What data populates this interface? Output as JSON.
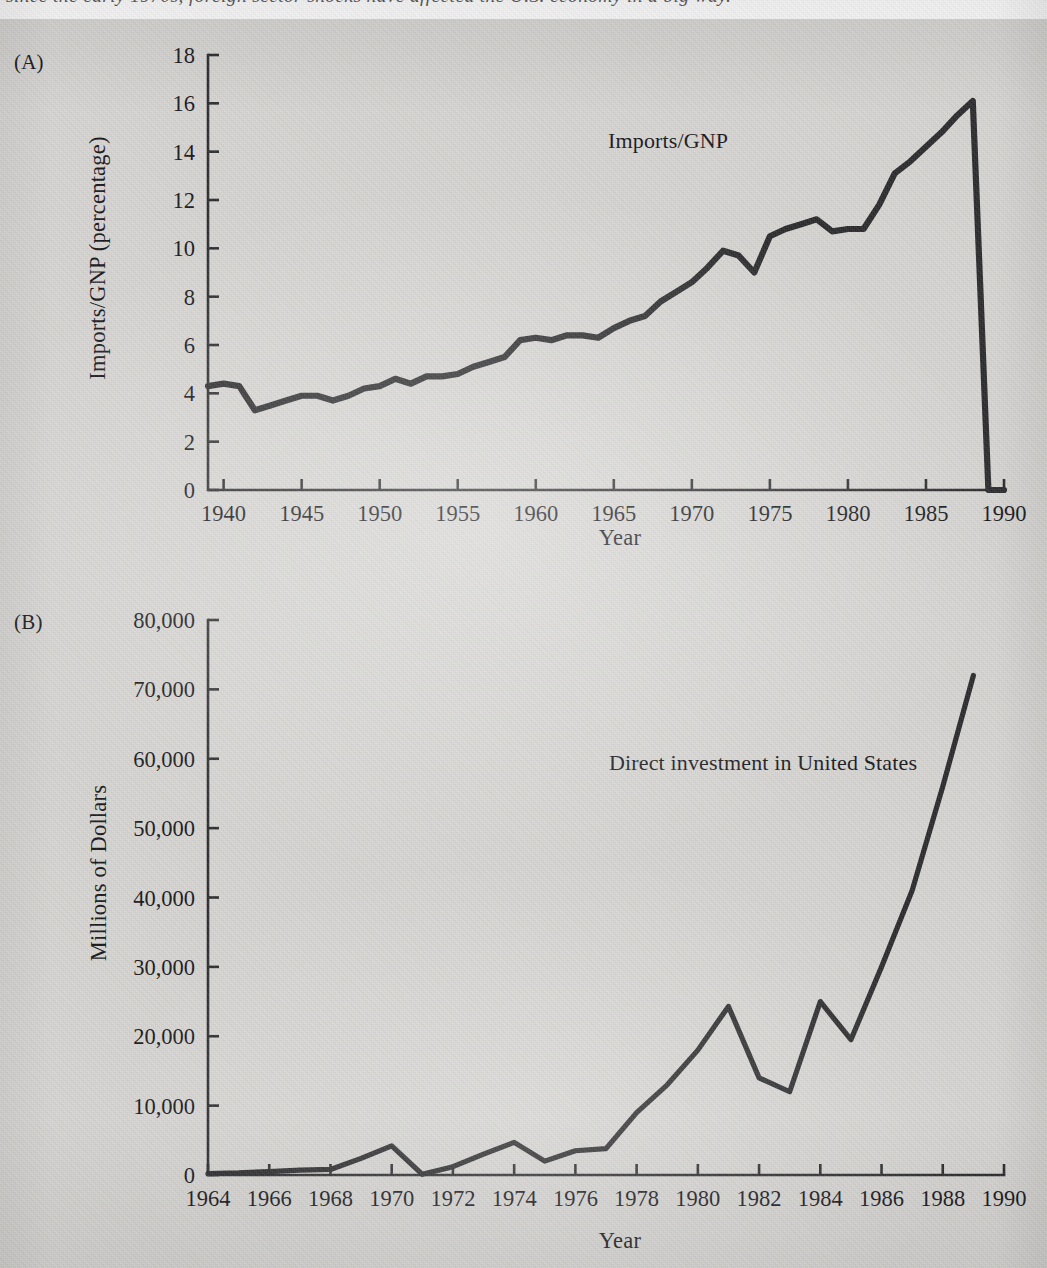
{
  "page": {
    "background_color": "#d7d6d3",
    "ink_color": "#2b2b2d",
    "caption_text": "since the early 1970s, foreign sector shocks have affected the U.S. economy in a big way."
  },
  "panel_a": {
    "letter": "(A)",
    "series_label": "Imports/GNP",
    "ylabel": "Imports/GNP (percentage)",
    "xlabel": "Year"
  },
  "panel_b": {
    "letter": "(B)",
    "series_label": "Direct investment in United States",
    "ylabel": "Millions of Dollars",
    "xlabel": "Year"
  },
  "chart_data": [
    {
      "type": "line",
      "id": "panel-a",
      "title": "(A) Imports/GNP",
      "xlabel": "Year",
      "ylabel": "Imports/GNP (percentage)",
      "xlim": [
        1939,
        1990
      ],
      "ylim": [
        0,
        18
      ],
      "yticks": [
        0,
        2,
        4,
        6,
        8,
        10,
        12,
        14,
        16,
        18
      ],
      "ytick_labels": [
        "0",
        "2",
        "4",
        "6",
        "8",
        "10",
        "12",
        "14",
        "16",
        "18"
      ],
      "xticks": [
        1940,
        1945,
        1950,
        1955,
        1960,
        1965,
        1970,
        1975,
        1980,
        1985,
        1990
      ],
      "xtick_labels": [
        "1940",
        "1945",
        "1950",
        "1955",
        "1960",
        "1965",
        "1970",
        "1975",
        "1980",
        "1985",
        "1990"
      ],
      "grid": false,
      "legend": "inline-annotation",
      "annotations": [
        {
          "text": "Imports/GNP",
          "x": 1976,
          "y": 14.1
        }
      ],
      "series": [
        {
          "name": "Imports/GNP",
          "x": [
            1939,
            1940,
            1941,
            1942,
            1943,
            1944,
            1945,
            1946,
            1947,
            1948,
            1949,
            1950,
            1951,
            1952,
            1953,
            1954,
            1955,
            1956,
            1957,
            1958,
            1959,
            1960,
            1961,
            1962,
            1963,
            1964,
            1965,
            1966,
            1967,
            1968,
            1969,
            1970,
            1971,
            1972,
            1973,
            1974,
            1975,
            1976,
            1977,
            1978,
            1979,
            1980,
            1981,
            1982,
            1983,
            1984,
            1985,
            1986,
            1987,
            1988,
            1989,
            1990
          ],
          "values": [
            4.3,
            4.4,
            4.3,
            3.3,
            3.5,
            3.7,
            3.9,
            3.9,
            3.7,
            3.9,
            4.2,
            4.3,
            4.6,
            4.4,
            4.7,
            4.7,
            4.8,
            5.1,
            5.3,
            5.5,
            6.2,
            6.3,
            6.2,
            6.4,
            6.4,
            6.3,
            6.7,
            7.0,
            7.2,
            7.8,
            8.2,
            8.6,
            9.2,
            9.9,
            9.7,
            9.0,
            10.5,
            10.8,
            11.0,
            11.2,
            10.7,
            10.8,
            10.8,
            11.8,
            13.1,
            13.6,
            14.2,
            14.8,
            15.5,
            16.1,
            0,
            0
          ]
        }
      ],
      "note": "last two entries unused; series drawn 1939-1989 ending near 16.1"
    },
    {
      "type": "line",
      "id": "panel-b",
      "title": "(B) Direct investment in United States",
      "xlabel": "Year",
      "ylabel": "Millions of Dollars",
      "xlim": [
        1964,
        1990
      ],
      "ylim": [
        0,
        80000
      ],
      "yticks": [
        0,
        10000,
        20000,
        30000,
        40000,
        50000,
        60000,
        70000,
        80000
      ],
      "ytick_labels": [
        "0",
        "10,000",
        "20,000",
        "30,000",
        "40,000",
        "50,000",
        "60,000",
        "70,000",
        "80,000"
      ],
      "xticks": [
        1964,
        1966,
        1968,
        1970,
        1972,
        1974,
        1976,
        1978,
        1980,
        1982,
        1984,
        1986,
        1988,
        1990
      ],
      "xtick_labels": [
        "1964",
        "1966",
        "1968",
        "1970",
        "1972",
        "1974",
        "1976",
        "1978",
        "1980",
        "1982",
        "1984",
        "1986",
        "1988",
        "1990"
      ],
      "grid": false,
      "legend": "inline-annotation",
      "annotations": [
        {
          "text": "Direct investment in United States",
          "x": 1977.2,
          "y": 55000
        }
      ],
      "series": [
        {
          "name": "Direct investment in United States",
          "x": [
            1964,
            1965,
            1966,
            1967,
            1968,
            1969,
            1970,
            1971,
            1972,
            1973,
            1974,
            1975,
            1976,
            1977,
            1978,
            1979,
            1980,
            1981,
            1982,
            1983,
            1984,
            1985,
            1986,
            1987,
            1988,
            1989
          ],
          "values": [
            200,
            300,
            500,
            700,
            800,
            2400,
            4200,
            100,
            1200,
            3000,
            4700,
            2000,
            3500,
            3800,
            9000,
            13000,
            18000,
            24300,
            14000,
            12000,
            25000,
            19500,
            30000,
            41000,
            56000,
            72000
          ]
        }
      ]
    }
  ]
}
